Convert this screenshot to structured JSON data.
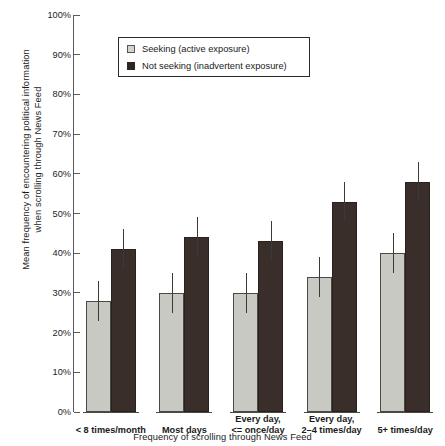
{
  "chart_data": {
    "type": "bar",
    "title": "",
    "xlabel": "Frequency of scrolling through News Feed",
    "ylabel": "Mean frequency of encountering political information\nwhen scrolling through News Feed",
    "categories": [
      "< 8 times/month",
      "Most days",
      "Every day,\n<= once/day",
      "Every day,\n2–4 times/day",
      "5+ times/day"
    ],
    "series": [
      {
        "name": "Seeking (active exposure)",
        "color": "#c9c9c4",
        "values": [
          28,
          30,
          30,
          34,
          40
        ],
        "errors": [
          5,
          5,
          5,
          5,
          5
        ]
      },
      {
        "name": "Not seeking (inadvertent exposure)",
        "color": "#3a2e2a",
        "values": [
          41,
          44,
          43,
          53,
          58
        ],
        "errors": [
          5,
          5,
          5,
          5,
          5
        ]
      }
    ],
    "ylim": [
      0,
      100
    ],
    "yticks": [
      "0%",
      "10%",
      "20%",
      "30%",
      "40%",
      "50%",
      "60%",
      "70%",
      "80%",
      "90%",
      "100%"
    ],
    "ytick_values": [
      0,
      10,
      20,
      30,
      40,
      50,
      60,
      70,
      80,
      90,
      100
    ],
    "grid": false,
    "legend_position": "top-center"
  },
  "legend": {
    "items": [
      {
        "label": "Seeking (active exposure)",
        "swatch": "light"
      },
      {
        "label": "Not seeking (inadvertent exposure)",
        "swatch": "dark"
      }
    ]
  }
}
